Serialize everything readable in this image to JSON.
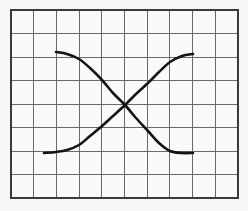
{
  "figure": {
    "title": "",
    "background_color": "#f8f7f5",
    "plot_background_color": "#fbfaf8",
    "width": 248,
    "height": 211
  },
  "grid": {
    "columns": 10,
    "rows": 8,
    "line_color": "#6a6a6a",
    "border_color": "#3a3a3a",
    "border_width": 2.4,
    "cell_width": 22.7,
    "cell_height": 23.5,
    "left": 11,
    "top": 10,
    "right": 238,
    "bottom": 198,
    "x_tick_labels": [],
    "y_tick_labels": [],
    "x_gridline_positions": [
      11,
      33.7,
      56.4,
      79.1,
      101.8,
      124.5,
      147.2,
      169.9,
      192.6,
      215.3,
      238
    ],
    "y_gridline_positions": [
      10,
      33.5,
      57,
      80.5,
      104,
      127.5,
      151,
      174.5,
      198
    ]
  },
  "chart_data": {
    "type": "line",
    "title": "",
    "xlabel": "",
    "ylabel": "",
    "xlim": [
      0,
      10
    ],
    "ylim": [
      0,
      8
    ],
    "grid": true,
    "legend_position": "none",
    "annotations": [],
    "crossing_point": {
      "x": 5.0,
      "y": 4.0
    },
    "series": [
      {
        "name": "descending-curve",
        "color": "#141414",
        "line_width": 2.6,
        "x": [
          2.0,
          2.5,
          3.0,
          3.5,
          4.0,
          4.5,
          5.0,
          5.5,
          6.0,
          6.5,
          7.0,
          7.5,
          8.0
        ],
        "y": [
          6.3,
          6.22,
          6.0,
          5.62,
          5.1,
          4.55,
          4.0,
          3.45,
          2.9,
          2.38,
          2.0,
          1.78,
          1.7
        ],
        "path_points_px": [
          [
            56,
            52
          ],
          [
            67,
            54
          ],
          [
            79,
            59
          ],
          [
            90,
            68
          ],
          [
            102,
            80
          ],
          [
            113,
            93
          ],
          [
            125,
            105
          ],
          [
            136,
            118
          ],
          [
            148,
            131
          ],
          [
            159,
            143
          ],
          [
            170,
            151
          ],
          [
            182,
            153
          ],
          [
            193,
            153
          ]
        ]
      },
      {
        "name": "ascending-curve",
        "color": "#141414",
        "line_width": 2.6,
        "x": [
          1.5,
          2.0,
          2.5,
          3.0,
          3.5,
          4.0,
          4.5,
          5.0,
          5.5,
          6.0,
          6.5,
          7.0,
          7.5,
          8.0
        ],
        "y": [
          1.7,
          1.72,
          1.8,
          2.0,
          2.35,
          2.85,
          3.42,
          4.0,
          4.6,
          5.15,
          5.62,
          5.98,
          6.18,
          6.25
        ],
        "path_points_px": [
          [
            44,
            153
          ],
          [
            56,
            152
          ],
          [
            67,
            150
          ],
          [
            79,
            145
          ],
          [
            90,
            136
          ],
          [
            102,
            126
          ],
          [
            113,
            116
          ],
          [
            125,
            105
          ],
          [
            136,
            94
          ],
          [
            148,
            83
          ],
          [
            159,
            72
          ],
          [
            170,
            62
          ],
          [
            182,
            56
          ],
          [
            193,
            54
          ]
        ]
      }
    ]
  },
  "icons": {
    "grid_icon": "grid-icon",
    "curve_icon": "curve-icon"
  }
}
